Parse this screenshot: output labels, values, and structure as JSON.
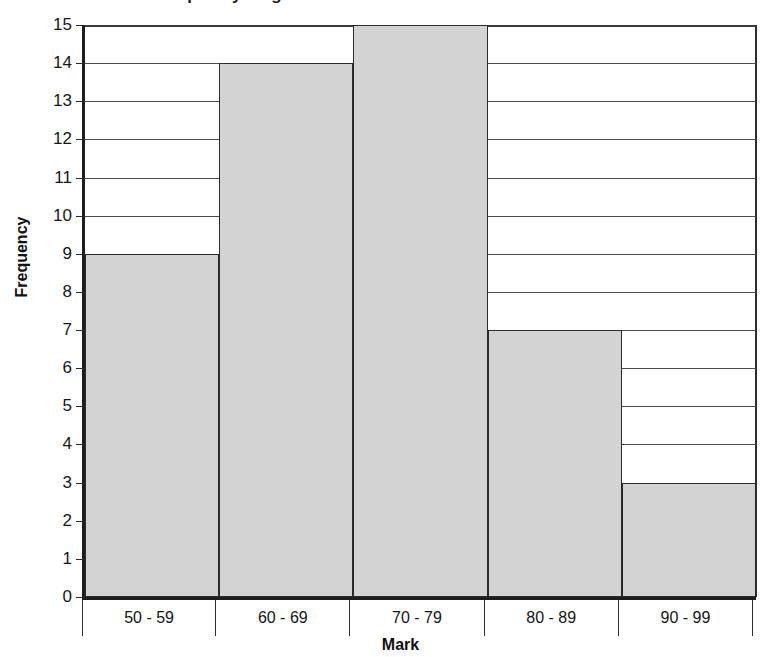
{
  "chart_data": {
    "type": "bar",
    "title": "A frequency diagram to show the results of a maths test",
    "xlabel": "Mark",
    "ylabel": "Frequency",
    "categories": [
      "50 - 59",
      "60 - 69",
      "70 - 79",
      "80 - 89",
      "90 - 99"
    ],
    "values": [
      9,
      14,
      15,
      7,
      3
    ],
    "ylim": [
      0,
      15
    ],
    "ytick_step": 1,
    "yticks": [
      15,
      14,
      13,
      12,
      11,
      10,
      9,
      8,
      7,
      6,
      5,
      4,
      3,
      2,
      1,
      0
    ],
    "ytick_labels": [
      "15",
      "14",
      "13",
      "12",
      "11",
      "10",
      "9",
      "8",
      "7",
      "6",
      "5",
      "4",
      "3",
      "2",
      "1",
      "0"
    ],
    "grid": true,
    "grid_axis": "y",
    "legend": false,
    "bar_fill_color": "#d3d3d3",
    "bar_edge_color": "#2a2a2a",
    "axis_color": "#1d1d1d",
    "background_color": "#ffffff",
    "bar_gap": 0
  }
}
